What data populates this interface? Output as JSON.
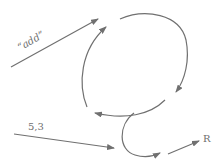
{
  "diagram": {
    "labels": {
      "input_top": "“add”",
      "input_bottom": "5,3",
      "output": "R"
    },
    "colors": {
      "stroke": "#707070",
      "text": "#6e6e6e",
      "background": "#ffffff"
    },
    "edges": [
      {
        "id": "add-input-arrow",
        "from": "label-add",
        "to": "loop"
      },
      {
        "id": "loop-top-arc",
        "direction": "clockwise"
      },
      {
        "id": "loop-left-arc",
        "direction": "upward"
      },
      {
        "id": "inner-return-arc",
        "direction": "leftward"
      },
      {
        "id": "hook-curve",
        "direction": "down-then-right"
      },
      {
        "id": "args-input-arrow",
        "from": "label-5-3",
        "to": "hook"
      },
      {
        "id": "result-output-arrow",
        "from": "hook",
        "to": "label-R"
      }
    ]
  }
}
